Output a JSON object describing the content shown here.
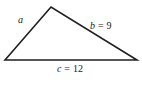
{
  "figure": {
    "type": "triangle-diagram",
    "background_color": "#ffffff",
    "stroke_color": "#1f1f1f",
    "stroke_width": 1.6,
    "vertices": {
      "left": {
        "x": 5,
        "y": 60
      },
      "apex": {
        "x": 51,
        "y": 7
      },
      "right": {
        "x": 137,
        "y": 60
      }
    },
    "labels": {
      "side_a": {
        "variable": "a",
        "separator": "",
        "value": "",
        "full_text": "a",
        "position": {
          "x": 18,
          "y": 15
        }
      },
      "side_b": {
        "variable": "b",
        "separator": " = ",
        "value": "9",
        "full_text": "b = 9",
        "position": {
          "x": 90,
          "y": 21
        }
      },
      "side_c": {
        "variable": "c",
        "separator": " = ",
        "value": "12",
        "full_text": "c = 12",
        "position": {
          "x": 57,
          "y": 64
        }
      }
    }
  }
}
